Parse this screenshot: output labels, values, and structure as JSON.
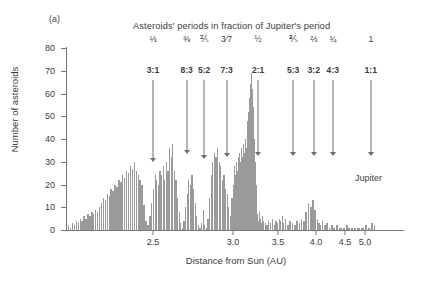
{
  "panel": {
    "label": "(a)"
  },
  "chart_title": "Asteroids' periods in fraction of Jupiter's period",
  "axes": {
    "y_title": "Number of asteroids",
    "x_title": "Distance from Sun (AU)",
    "y_ticks": [
      "0",
      "10",
      "20",
      "30",
      "40",
      "50",
      "60",
      "70",
      "80"
    ],
    "x_ticks": [
      "2.5",
      "3.0",
      "3.5",
      "4.0",
      "4.5",
      "5.0"
    ]
  },
  "jupiter_label": "Jupiter",
  "resonances": [
    {
      "fraction": "⅓",
      "ratio": "3:1",
      "au": "2.50"
    },
    {
      "fraction": "⅜",
      "ratio": "8:3",
      "au": "2.71"
    },
    {
      "fraction": "⅖",
      "ratio": "5:2",
      "au": "2.82"
    },
    {
      "fraction": "3⁄7",
      "ratio": "7:3",
      "au": "2.96"
    },
    {
      "fraction": "½",
      "ratio": "2:1",
      "au": "3.28"
    },
    {
      "fraction": "⅗",
      "ratio": "5:3",
      "au": "3.70"
    },
    {
      "fraction": "⅔",
      "ratio": "3:2",
      "au": "3.97"
    },
    {
      "fraction": "¾",
      "ratio": "4:3",
      "au": "4.29"
    },
    {
      "fraction": "1",
      "ratio": "1:1",
      "au": "5.20"
    }
  ],
  "colors": {
    "bar": "#9a9a9a",
    "axis": "#777777",
    "text": "#3c3c3c",
    "arrow": "#6f6f6f"
  },
  "chart_data": {
    "type": "bar",
    "title": "Asteroids' periods in fraction of Jupiter's period",
    "subtitle": "(a)",
    "xlabel": "Distance from Sun (AU)",
    "ylabel": "Number of asteroids",
    "ylim": [
      0,
      80
    ],
    "xlim": [
      2.05,
      5.45
    ],
    "grid": false,
    "legend": null,
    "x_tick_values": [
      2.5,
      3.0,
      3.5,
      4.0,
      4.5,
      5.0
    ],
    "y_tick_values": [
      0,
      10,
      20,
      30,
      40,
      50,
      60,
      70,
      80
    ],
    "x_scale_note": "non-linear: horizontal scale compresses progressively toward larger distances",
    "annotations": [
      {
        "text": "3:1",
        "fraction": "1/3",
        "x": 2.5
      },
      {
        "text": "8:3",
        "fraction": "3/8",
        "x": 2.71
      },
      {
        "text": "5:2",
        "fraction": "2/5",
        "x": 2.82
      },
      {
        "text": "7:3",
        "fraction": "3/7",
        "x": 2.96
      },
      {
        "text": "2:1",
        "fraction": "1/2",
        "x": 3.28
      },
      {
        "text": "5:3",
        "fraction": "3/5",
        "x": 3.7
      },
      {
        "text": "3:2",
        "fraction": "2/3",
        "x": 3.97
      },
      {
        "text": "4:3",
        "fraction": "3/4",
        "x": 4.29
      },
      {
        "text": "1:1",
        "fraction": "1",
        "x": 5.2,
        "label": "Jupiter"
      }
    ],
    "bin_width_au": 0.01,
    "x": [
      2.06,
      2.07,
      2.08,
      2.09,
      2.1,
      2.11,
      2.12,
      2.13,
      2.14,
      2.15,
      2.16,
      2.17,
      2.18,
      2.19,
      2.2,
      2.21,
      2.22,
      2.23,
      2.24,
      2.25,
      2.26,
      2.27,
      2.28,
      2.29,
      2.3,
      2.31,
      2.32,
      2.33,
      2.34,
      2.35,
      2.36,
      2.37,
      2.38,
      2.39,
      2.4,
      2.41,
      2.42,
      2.43,
      2.44,
      2.45,
      2.46,
      2.47,
      2.48,
      2.49,
      2.5,
      2.51,
      2.52,
      2.53,
      2.54,
      2.55,
      2.56,
      2.57,
      2.58,
      2.59,
      2.6,
      2.61,
      2.62,
      2.63,
      2.64,
      2.65,
      2.66,
      2.67,
      2.68,
      2.69,
      2.7,
      2.71,
      2.72,
      2.73,
      2.74,
      2.75,
      2.76,
      2.77,
      2.78,
      2.79,
      2.8,
      2.81,
      2.82,
      2.83,
      2.84,
      2.85,
      2.86,
      2.87,
      2.88,
      2.89,
      2.9,
      2.91,
      2.92,
      2.93,
      2.94,
      2.95,
      2.96,
      2.97,
      2.98,
      2.99,
      3.0,
      3.01,
      3.02,
      3.03,
      3.04,
      3.05,
      3.06,
      3.07,
      3.08,
      3.09,
      3.1,
      3.11,
      3.12,
      3.13,
      3.14,
      3.15,
      3.16,
      3.17,
      3.18,
      3.19,
      3.2,
      3.21,
      3.22,
      3.23,
      3.24,
      3.25,
      3.26,
      3.27,
      3.28,
      3.29,
      3.3,
      3.31,
      3.32,
      3.33,
      3.35,
      3.37,
      3.39,
      3.41,
      3.43,
      3.45,
      3.47,
      3.49,
      3.51,
      3.53,
      3.55,
      3.57,
      3.59,
      3.62,
      3.65,
      3.68,
      3.71,
      3.74,
      3.77,
      3.8,
      3.83,
      3.86,
      3.89,
      3.92,
      3.95,
      3.98,
      4.01,
      4.04,
      4.07,
      4.1,
      4.14,
      4.18,
      4.22,
      4.26,
      4.3,
      4.35,
      4.4,
      4.46,
      4.52,
      4.58,
      4.65,
      4.72,
      4.8,
      4.9,
      5.0,
      5.1,
      5.2,
      5.3
    ],
    "values": [
      2,
      1,
      3,
      2,
      4,
      3,
      5,
      4,
      6,
      5,
      7,
      6,
      8,
      7,
      9,
      8,
      10,
      12,
      14,
      13,
      16,
      15,
      18,
      17,
      20,
      19,
      22,
      21,
      24,
      23,
      26,
      25,
      28,
      27,
      30,
      26,
      24,
      22,
      20,
      11,
      4,
      2,
      6,
      12,
      18,
      24,
      22,
      20,
      26,
      24,
      28,
      22,
      30,
      26,
      36,
      32,
      38,
      26,
      22,
      14,
      8,
      3,
      1,
      4,
      10,
      16,
      22,
      20,
      24,
      18,
      12,
      6,
      2,
      1,
      3,
      9,
      2,
      1,
      5,
      14,
      24,
      30,
      34,
      32,
      36,
      30,
      28,
      22,
      24,
      18,
      16,
      10,
      6,
      14,
      20,
      28,
      24,
      30,
      26,
      32,
      28,
      34,
      30,
      36,
      32,
      38,
      34,
      40,
      36,
      44,
      48,
      52,
      58,
      64,
      69,
      62,
      54,
      40,
      30,
      20,
      12,
      7,
      4,
      8,
      5,
      3,
      6,
      4,
      3,
      2,
      4,
      3,
      5,
      2,
      4,
      3,
      5,
      4,
      6,
      3,
      5,
      2,
      4,
      3,
      2,
      4,
      3,
      5,
      4,
      8,
      12,
      10,
      13,
      9,
      5,
      3,
      2,
      4,
      2,
      3,
      1,
      2,
      1,
      2,
      1,
      1,
      2,
      1,
      1,
      1,
      1,
      1,
      2,
      1,
      3,
      2
    ]
  }
}
